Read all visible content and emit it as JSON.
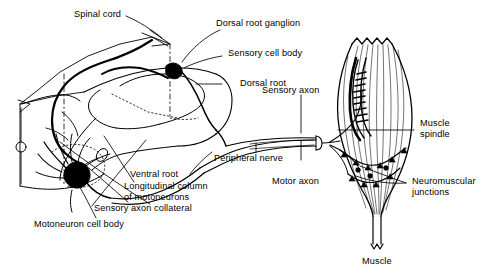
{
  "figure": {
    "ink_color": "#000000",
    "background_color": "#ffffff",
    "labels": {
      "spinal_cord": "Spinal cord",
      "dorsal_root_ganglion": "Dorsal root ganglion",
      "sensory_cell_body": "Sensory cell body",
      "dorsal_root": "Dorsal root",
      "sensory_axon": "Sensory axon",
      "muscle_spindle_line1": "Muscle",
      "muscle_spindle_line2": "spindle",
      "neuromuscular_line1": "Neuromuscular",
      "neuromuscular_line2": "junctions",
      "peripheral_nerve": "Peripheral nerve",
      "motor_axon": "Motor axon",
      "ventral_root": "Ventral root",
      "longitudinal_column_line1": "Longitudinal column",
      "longitudinal_column_line2": "of motoneurons",
      "sensory_axon_collateral": "Sensory axon collateral",
      "motoneuron_cell_body": "Motoneuron cell body",
      "muscle": "Muscle"
    }
  }
}
